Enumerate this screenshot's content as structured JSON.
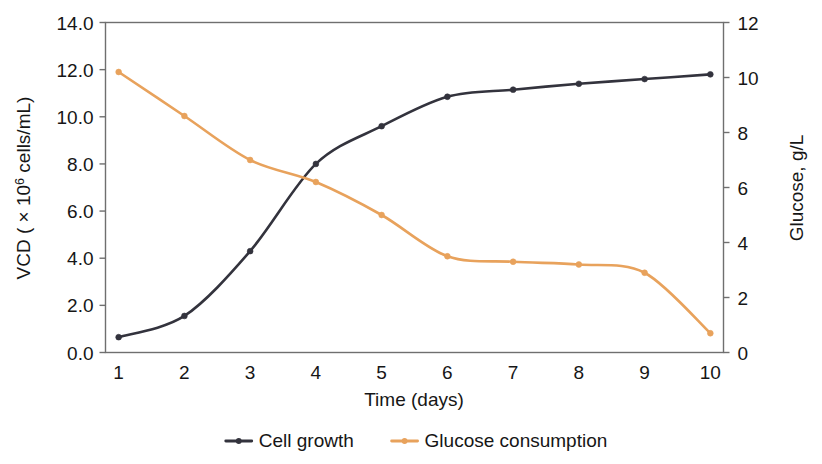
{
  "chart_data": {
    "type": "line",
    "title": "",
    "xlabel": "Time (days)",
    "x": [
      1,
      2,
      3,
      4,
      5,
      6,
      7,
      8,
      9,
      10
    ],
    "xtick_labels": [
      "1",
      "2",
      "3",
      "4",
      "5",
      "6",
      "7",
      "8",
      "9",
      "10"
    ],
    "xlim": [
      0.8,
      10.2
    ],
    "grid": false,
    "legend_position": "bottom",
    "axes": {
      "left": {
        "label_plain": "VCD ( × 10⁶ cells/mL)",
        "label_prefix": "VCD ( × 10",
        "label_exponent": "6",
        "label_suffix": " cells/mL)",
        "ylim": [
          0.0,
          14.0
        ],
        "tick_step": 2.0,
        "tick_labels": [
          "0.0",
          "2.0",
          "4.0",
          "6.0",
          "8.0",
          "10.0",
          "12.0",
          "14.0"
        ],
        "tick_values": [
          0.0,
          2.0,
          4.0,
          6.0,
          8.0,
          10.0,
          12.0,
          14.0
        ]
      },
      "right": {
        "label": "Glucose, g/L",
        "ylim": [
          0,
          12
        ],
        "tick_step": 2,
        "tick_labels": [
          "0",
          "2",
          "4",
          "6",
          "8",
          "10",
          "12"
        ],
        "tick_values": [
          0,
          2,
          4,
          6,
          8,
          10,
          12
        ]
      }
    },
    "series": [
      {
        "name": "Cell growth",
        "axis": "left",
        "color": "#33333d",
        "marker": "circle",
        "values": [
          0.65,
          1.55,
          4.3,
          8.0,
          9.6,
          10.85,
          11.15,
          11.4,
          11.6,
          11.8
        ]
      },
      {
        "name": "Glucose consumption",
        "axis": "right",
        "color": "#e8a25c",
        "marker": "circle",
        "values": [
          10.2,
          8.6,
          7.0,
          6.2,
          5.0,
          3.5,
          3.3,
          3.2,
          2.9,
          0.7
        ]
      }
    ],
    "legend": [
      {
        "label": "Cell growth",
        "color": "#33333d"
      },
      {
        "label": "Glucose consumption",
        "color": "#e8a25c"
      }
    ]
  }
}
